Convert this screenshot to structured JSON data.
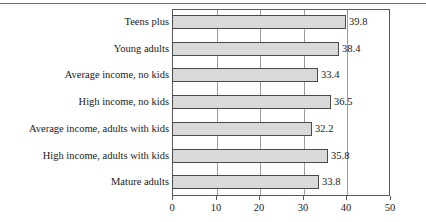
{
  "chart_data": {
    "type": "bar",
    "orientation": "horizontal",
    "title": "",
    "subtitle": "",
    "xlabel": "",
    "ylabel": "",
    "xlim": [
      0,
      50
    ],
    "xticks": [
      0,
      10,
      20,
      30,
      40,
      50
    ],
    "xtick_labels": [
      "0",
      "10",
      "20",
      "30",
      "40",
      "50"
    ],
    "grid": true,
    "grid_axis": "x",
    "legend": false,
    "legend_position": "none",
    "categories": [
      "Teens plus",
      "Young adults",
      "Average income, no kids",
      "High income, no kids",
      "Average income, adults with kids",
      "High income, adults with kids",
      "Mature adults"
    ],
    "values": [
      39.8,
      38.4,
      33.4,
      36.5,
      32.2,
      35.8,
      33.8
    ],
    "value_labels": [
      "39.8",
      "38.4",
      "33.4",
      "36.5",
      "32.2",
      "35.8",
      "33.8"
    ],
    "bar_fill_color": "#d9d9d9",
    "bar_border_color": "#4a4a4a",
    "axis_color": "#5a5a5a",
    "gridline_color": "#9b9b9b",
    "text_color": "#1a1a1a",
    "background_color": "#ffffff"
  },
  "decor": {
    "top_rule_color": "#6b6b6b"
  }
}
